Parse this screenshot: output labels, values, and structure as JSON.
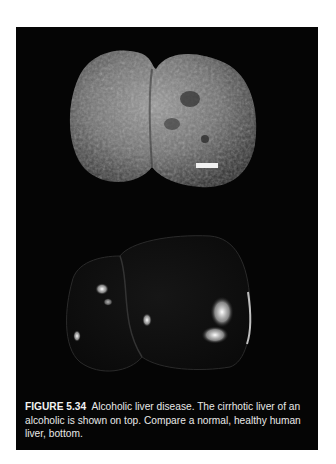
{
  "figure": {
    "label": "FIGURE 5.34",
    "caption": "Alcoholic liver disease. The cirrhotic liver of an alcoholic is shown on top. Compare a normal, healthy human liver, bottom.",
    "images": [
      {
        "name": "cirrhotic-liver",
        "position": "top",
        "description": "Cirrhotic liver of an alcoholic, nodular grey surface with a small white scale bar"
      },
      {
        "name": "healthy-liver",
        "position": "bottom",
        "description": "Normal healthy human liver, smooth dark glossy surface with specular highlights"
      }
    ],
    "colors": {
      "panel": "#050505",
      "page": "#ffffff",
      "caption_text": "#e8e8e8"
    }
  }
}
